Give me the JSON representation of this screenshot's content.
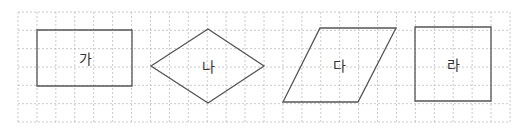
{
  "grid": {
    "x0": 18,
    "y0": 12,
    "x1": 510,
    "y1": 122,
    "cols": 26,
    "rows": 6,
    "color": "#bdbdbd"
  },
  "stroke_color": "#555555",
  "text_color": "#333333",
  "shapes": [
    {
      "id": "ga",
      "label": "가",
      "type": "rectangle",
      "points": [
        [
          37,
          30
        ],
        [
          132,
          30
        ],
        [
          132,
          86
        ],
        [
          37,
          86
        ]
      ],
      "label_pos": [
        85,
        58
      ]
    },
    {
      "id": "na",
      "label": "나",
      "type": "rhombus",
      "points": [
        [
          151,
          66
        ],
        [
          208,
          29
        ],
        [
          264,
          66
        ],
        [
          208,
          103
        ]
      ],
      "label_pos": [
        208,
        66
      ]
    },
    {
      "id": "da",
      "label": "다",
      "type": "parallelogram",
      "points": [
        [
          320,
          28
        ],
        [
          396,
          28
        ],
        [
          358,
          102
        ],
        [
          283,
          102
        ]
      ],
      "label_pos": [
        339,
        65
      ]
    },
    {
      "id": "ra",
      "label": "라",
      "type": "square",
      "points": [
        [
          415,
          27
        ],
        [
          491,
          27
        ],
        [
          491,
          101
        ],
        [
          415,
          101
        ]
      ],
      "label_pos": [
        453,
        64
      ]
    }
  ]
}
